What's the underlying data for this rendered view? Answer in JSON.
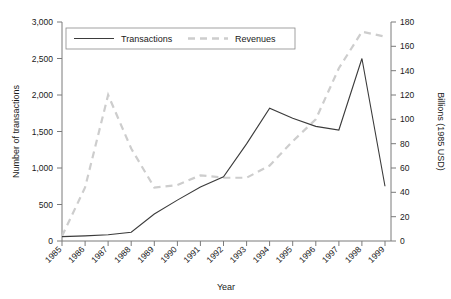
{
  "chart_data": {
    "type": "line",
    "title": "",
    "xlabel": "Year",
    "categories": [
      "1985",
      "1986",
      "1987",
      "1988",
      "1989",
      "1990",
      "1991",
      "1992",
      "1993",
      "1994",
      "1995",
      "1996",
      "1997",
      "1998",
      "1999"
    ],
    "grid": false,
    "legend_position": "top-center",
    "axes": {
      "left": {
        "label": "Number of transactions",
        "ticks": [
          "0",
          "500",
          "1,000",
          "1,500",
          "2,000",
          "2,500",
          "3,000"
        ],
        "tick_values": [
          0,
          500,
          1000,
          1500,
          2000,
          2500,
          3000
        ],
        "ylim": [
          0,
          3000
        ]
      },
      "right": {
        "label": "Billions (1985 USD)",
        "ticks": [
          "0",
          "20",
          "40",
          "60",
          "80",
          "100",
          "120",
          "140",
          "160",
          "180"
        ],
        "tick_values": [
          0,
          20,
          40,
          60,
          80,
          100,
          120,
          140,
          160,
          180
        ],
        "ylim": [
          0,
          180
        ]
      }
    },
    "series": [
      {
        "name": "Transactions",
        "axis": "left",
        "style": "solid",
        "color": "#3b3b3b",
        "values": [
          60,
          70,
          85,
          120,
          370,
          560,
          740,
          880,
          1330,
          1820,
          1680,
          1570,
          1520,
          2500,
          750
        ]
      },
      {
        "name": "Revenues",
        "axis": "right",
        "style": "dashed",
        "color": "#cdcdcd",
        "values": [
          4,
          44,
          120,
          76,
          44,
          46,
          54,
          52,
          52,
          62,
          82,
          100,
          142,
          172,
          168
        ]
      }
    ]
  },
  "legend": {
    "entries": [
      {
        "label": "Transactions"
      },
      {
        "label": "Revenues"
      }
    ]
  }
}
